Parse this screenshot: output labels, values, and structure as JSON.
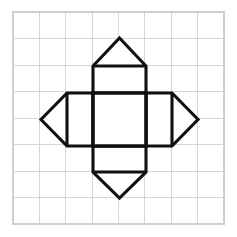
{
  "figure": {
    "background_color": "#ffffff",
    "stroke_color": "#101010",
    "stroke_width": 3.1,
    "fill_color": "#ffffff"
  },
  "grid": {
    "name": "background-grid",
    "columns": 8,
    "rows": 8,
    "cell_size": 26.375,
    "origin_x": 13,
    "origin_y": 12,
    "width": 211,
    "height": 212,
    "line_color": "#d6d6d6",
    "border_color": "#cfcfcf",
    "line_width": 1
  },
  "shapes": {
    "center_square": {
      "name": "center-square",
      "label": "Central square face",
      "points": "93,93 146,93 146,146 93,146",
      "x": 93,
      "y": 93,
      "width": 53,
      "height": 53
    },
    "top_flap": {
      "name": "top-flap",
      "label": "Top flap (rectangle + triangle)",
      "points": "93,93 93,66 119.5,38 146,66 146,93"
    },
    "bottom_flap": {
      "name": "bottom-flap",
      "label": "Bottom flap (rectangle + triangle)",
      "points": "93,146 93,172 119.5,198 146,172 146,146"
    },
    "left_flap": {
      "name": "left-flap",
      "label": "Left flap (rectangle + triangle)",
      "points": "93,93 67,93 41,119.5 67,146 93,146"
    },
    "right_flap": {
      "name": "right-flap",
      "label": "Right flap (rectangle + triangle)",
      "points": "146,93 172,93 198,119.5 172,146 146,146"
    }
  },
  "fold_edges": [
    {
      "name": "fold-edge-top",
      "x1": 93,
      "y1": 93,
      "x2": 146,
      "y2": 93
    },
    {
      "name": "fold-edge-bottom",
      "x1": 93,
      "y1": 146,
      "x2": 146,
      "y2": 146
    },
    {
      "name": "fold-edge-left",
      "x1": 93,
      "y1": 93,
      "x2": 93,
      "y2": 146
    },
    {
      "name": "fold-edge-right",
      "x1": 146,
      "y1": 93,
      "x2": 146,
      "y2": 146
    },
    {
      "name": "crease-top-flap-base",
      "x1": 93,
      "y1": 66,
      "x2": 146,
      "y2": 66
    },
    {
      "name": "crease-bottom-flap-base",
      "x1": 93,
      "y1": 172,
      "x2": 146,
      "y2": 172
    },
    {
      "name": "crease-left-flap-base",
      "x1": 67,
      "y1": 93,
      "x2": 67,
      "y2": 146
    },
    {
      "name": "crease-right-flap-base",
      "x1": 172,
      "y1": 93,
      "x2": 172,
      "y2": 146
    }
  ],
  "vertices": {
    "top_apex": {
      "name": "apex-top",
      "x": 119.5,
      "y": 38
    },
    "bottom_apex": {
      "name": "apex-bottom",
      "x": 119.5,
      "y": 198
    },
    "left_apex": {
      "name": "apex-left",
      "x": 41,
      "y": 119.5
    },
    "right_apex": {
      "name": "apex-right",
      "x": 198,
      "y": 119.5
    }
  },
  "chart_data": {
    "type": "scatter",
    "title": "",
    "xlabel": "",
    "ylabel": "",
    "xlim": [
      0,
      8
    ],
    "ylim": [
      0,
      8
    ],
    "grid": true,
    "legend": "none",
    "annotations": [
      "Central square spans grid cells 3-5 horizontally and 3-5 vertically",
      "Each flap extends one cell outward plus a one-cell triangular point"
    ]
  }
}
